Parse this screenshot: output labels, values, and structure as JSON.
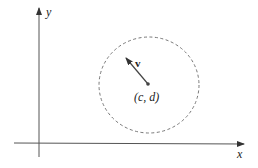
{
  "diagram": {
    "axes": {
      "x_label": "x",
      "y_label": "y",
      "origin_px": [
        39,
        143
      ]
    },
    "circle": {
      "center_px": [
        149,
        85
      ],
      "radius_px": 49,
      "style": "dashed",
      "color": "#777777"
    },
    "vector": {
      "label": "v",
      "from_px": [
        148,
        84
      ],
      "to_px": [
        125,
        57
      ]
    },
    "center_point": {
      "label": "(c, d)"
    }
  }
}
